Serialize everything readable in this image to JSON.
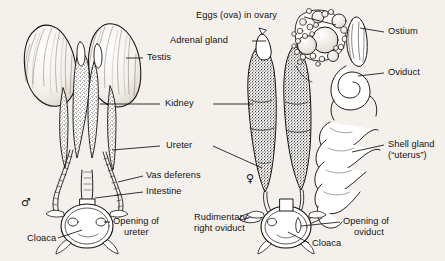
{
  "figure": {
    "background_color": "#f4f1ec",
    "ink_color": "#14110e",
    "specimens": [
      {
        "id": "male",
        "symbol": "♂",
        "symbol_name": "male-symbol"
      },
      {
        "id": "female",
        "symbol": "♀",
        "symbol_name": "female-symbol"
      }
    ]
  },
  "labels": {
    "eggs_in_ovary": "Eggs (ova) in ovary",
    "adrenal_gland": "Adrenal gland",
    "testis": "Testis",
    "kidney": "Kidney",
    "ureter": "Ureter",
    "vas_deferens": "Vas deferens",
    "intestine": "Intestine",
    "opening_of_ureter_l1": "Opening of",
    "opening_of_ureter_l2": "ureter",
    "cloaca_male": "Cloaca",
    "rudimentary_oviduct_l1": "Rudimentary",
    "rudimentary_oviduct_l2": "right oviduct",
    "cloaca_female": "Cloaca",
    "opening_of_oviduct_l1": "Opening of",
    "opening_of_oviduct_l2": "oviduct",
    "ostium": "Ostium",
    "oviduct": "Oviduct",
    "shell_gland_l1": "Shell gland",
    "shell_gland_l2": "(“uterus”)"
  },
  "structures": {
    "male": [
      "testis",
      "kidney",
      "ureter",
      "vas deferens",
      "intestine",
      "cloaca",
      "opening of ureter"
    ],
    "female": [
      "ovary with ova",
      "adrenal gland",
      "kidney",
      "ureter",
      "ostium",
      "oviduct",
      "shell gland (uterus)",
      "rudimentary right oviduct",
      "cloaca",
      "opening of oviduct"
    ]
  }
}
